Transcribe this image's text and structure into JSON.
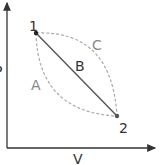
{
  "diagram": {
    "type": "pv-diagram",
    "axes": {
      "x_label": "V",
      "y_label": "P"
    },
    "points": [
      {
        "id": "1",
        "label": "1"
      },
      {
        "id": "2",
        "label": "2"
      }
    ],
    "paths": [
      {
        "id": "A",
        "label": "A",
        "style": "dashed",
        "description": "curved path bowing down-left from 1 to 2"
      },
      {
        "id": "B",
        "label": "B",
        "style": "solid",
        "description": "straight line from 1 to 2"
      },
      {
        "id": "C",
        "label": "C",
        "style": "dashed",
        "description": "curved path bowing up-right from 1 to 2"
      }
    ],
    "colors": {
      "axis": "#333333",
      "solid_path": "#555555",
      "dashed_path": "#aaaaaa",
      "label_light": "#888888"
    }
  }
}
